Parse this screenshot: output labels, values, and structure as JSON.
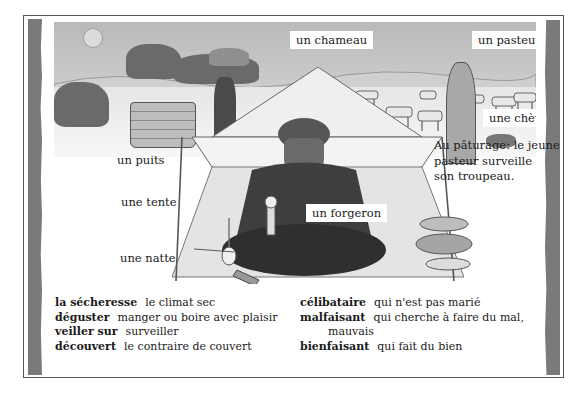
{
  "illustration": {
    "labels": {
      "camel": "un chameau",
      "shepherd": "un pasteur",
      "goat": "une chèvre",
      "well": "un puits",
      "tent": "une tente",
      "blacksmith": "un forgeron",
      "mat": "une natte"
    },
    "caption_lines": [
      "Au pâturage: le jeune",
      "pasteur surveille",
      "son troupeau."
    ]
  },
  "vocabulary": {
    "left": [
      {
        "term": "la sécheresse",
        "definition": "le climat sec"
      },
      {
        "term": "déguster",
        "definition": "manger ou boire avec plaisir"
      },
      {
        "term": "veiller sur",
        "definition": "surveiller"
      },
      {
        "term": "découvert",
        "definition": "le contraire de couvert"
      }
    ],
    "right": [
      {
        "term": "célibataire",
        "definition": "qui n'est pas marié"
      },
      {
        "term": "malfaisant",
        "definition": "qui cherche à faire du mal,",
        "continuation": "mauvais"
      },
      {
        "term": "bienfaisant",
        "definition": "qui fait du bien"
      }
    ]
  },
  "colors": {
    "frame_border": "#555555",
    "side_bars": "#7a7a7a",
    "text": "#1a1a1a"
  }
}
